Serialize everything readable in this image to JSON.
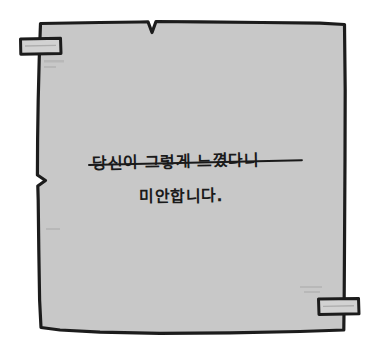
{
  "scene": {
    "type": "handwritten-note",
    "background_color": "#ffffff",
    "paper_fill_color": "#c8c8c8",
    "paper_border_color": "#1c1c1c",
    "ink_color": "#1a1a1a",
    "tape_fill_color": "#d2d2d2",
    "tape_border_color": "#1c1c1c"
  },
  "note": {
    "label": "taped paper note",
    "lines": [
      {
        "id": "line-1",
        "text": "당신이 그렇게 느꼈다니",
        "struck_through": true
      },
      {
        "id": "line-2",
        "text": "미안합니다.",
        "struck_through": false
      }
    ]
  },
  "tape": [
    {
      "id": "tape-top-left",
      "position": "top-left"
    },
    {
      "id": "tape-bottom-right",
      "position": "bottom-right"
    }
  ]
}
